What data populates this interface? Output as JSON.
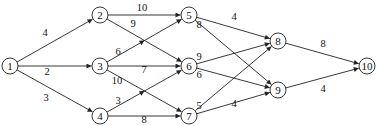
{
  "diagram": {
    "type": "directed-weighted-graph",
    "nodes": [
      {
        "id": "1",
        "label": "1",
        "x": 10,
        "y": 66
      },
      {
        "id": "2",
        "label": "2",
        "x": 100,
        "y": 15
      },
      {
        "id": "3",
        "label": "3",
        "x": 100,
        "y": 66
      },
      {
        "id": "4",
        "label": "4",
        "x": 100,
        "y": 116
      },
      {
        "id": "5",
        "label": "5",
        "x": 189,
        "y": 15
      },
      {
        "id": "6",
        "label": "6",
        "x": 189,
        "y": 66
      },
      {
        "id": "7",
        "label": "7",
        "x": 189,
        "y": 116
      },
      {
        "id": "8",
        "label": "8",
        "x": 278,
        "y": 41
      },
      {
        "id": "9",
        "label": "9",
        "x": 278,
        "y": 90
      },
      {
        "id": "10",
        "label": "10",
        "x": 367,
        "y": 66
      }
    ],
    "edges": [
      {
        "from": "1",
        "to": "2",
        "weight": "4",
        "lx": 45,
        "ly": 36
      },
      {
        "from": "1",
        "to": "3",
        "weight": "2",
        "lx": 47,
        "ly": 75
      },
      {
        "from": "1",
        "to": "4",
        "weight": "3",
        "lx": 46,
        "ly": 101
      },
      {
        "from": "2",
        "to": "5",
        "weight": "10",
        "lx": 142,
        "ly": 11
      },
      {
        "from": "2",
        "to": "6",
        "weight": "9",
        "lx": 133,
        "ly": 27
      },
      {
        "from": "3",
        "to": "5",
        "weight": "6",
        "lx": 118,
        "ly": 55,
        "mid_arrow": true
      },
      {
        "from": "3",
        "to": "6",
        "weight": "7",
        "lx": 144,
        "ly": 73
      },
      {
        "from": "3",
        "to": "7",
        "weight": "10",
        "lx": 117,
        "ly": 84
      },
      {
        "from": "4",
        "to": "6",
        "weight": "3",
        "lx": 118,
        "ly": 104,
        "mid_arrow": true
      },
      {
        "from": "4",
        "to": "7",
        "weight": "8",
        "lx": 144,
        "ly": 123
      },
      {
        "from": "5",
        "to": "8",
        "weight": "4",
        "lx": 234,
        "ly": 20
      },
      {
        "from": "5",
        "to": "9",
        "weight": "8",
        "lx": 199,
        "ly": 28
      },
      {
        "from": "6",
        "to": "8",
        "weight": "9",
        "lx": 199,
        "ly": 60
      },
      {
        "from": "6",
        "to": "9",
        "weight": "6",
        "lx": 199,
        "ly": 78
      },
      {
        "from": "7",
        "to": "8",
        "weight": "5",
        "lx": 199,
        "ly": 109
      },
      {
        "from": "7",
        "to": "9",
        "weight": "4",
        "lx": 234,
        "ly": 107
      },
      {
        "from": "8",
        "to": "10",
        "weight": "8",
        "lx": 323,
        "ly": 47
      },
      {
        "from": "9",
        "to": "10",
        "weight": "4",
        "lx": 323,
        "ly": 92
      }
    ],
    "node_radius": 8,
    "colors": {
      "stroke": "#222222",
      "background": "#ffffff",
      "text": "#111111"
    }
  }
}
